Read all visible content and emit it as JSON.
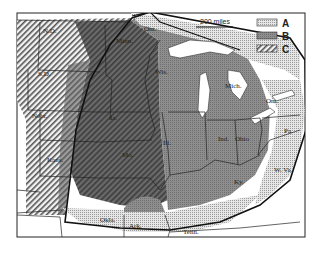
{
  "map": {
    "scale_bar": {
      "label": "200 miles"
    },
    "legend": [
      {
        "key": "A",
        "pattern": "light-dotted",
        "color": "#d8d8d8"
      },
      {
        "key": "B",
        "pattern": "gray",
        "color": "#8c8c8c"
      },
      {
        "key": "C",
        "pattern": "hatched",
        "color": "#bdbdbd"
      }
    ],
    "labels": {
      "nd": "N.D.",
      "sd": "S.D.",
      "nebr": "Nebr.",
      "kans": "Kans.",
      "minn": "Minn.",
      "ont_north": "Ont.",
      "wis": "Wis.",
      "ia": "Ia.",
      "ill": "Ill.",
      "mo": "Mo.",
      "mich": "Mich.",
      "ont_east": "Ont.",
      "pa": "Pa.",
      "ind": "Ind.",
      "ohio": "Ohio",
      "ky": "Ky.",
      "wva": "W. Va.",
      "okla": "Okla.",
      "ark": "Ark.",
      "tenn": "Tenn."
    }
  }
}
